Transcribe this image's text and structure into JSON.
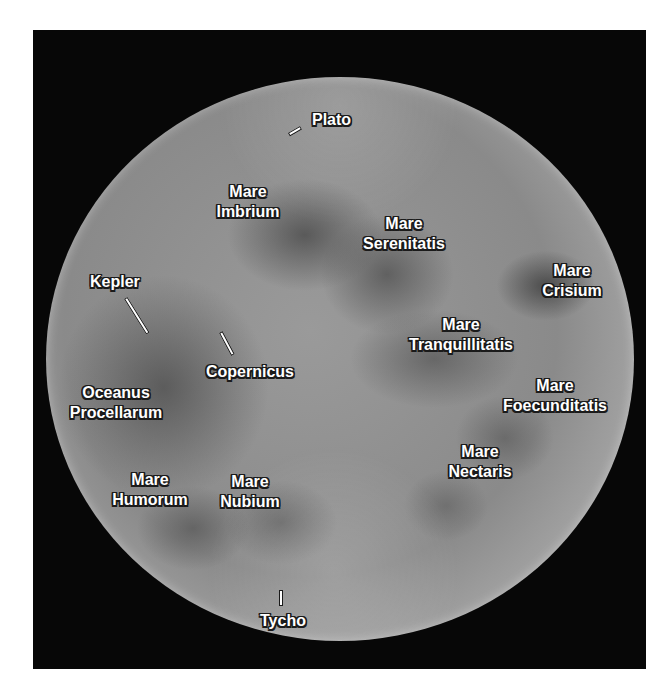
{
  "image": {
    "subject": "full-moon-map",
    "background_color": "#ffffff",
    "frame_color": "#070707",
    "label_color": "#ffffff",
    "label_outline_color": "#1a1a1a"
  },
  "labels": {
    "plato": {
      "line1": "Plato"
    },
    "mare_imbrium": {
      "line1": "Mare",
      "line2": "Imbrium"
    },
    "mare_serenitatis": {
      "line1": "Mare",
      "line2": "Serenitatis"
    },
    "kepler": {
      "line1": "Kepler"
    },
    "mare_crisium": {
      "line1": "Mare",
      "line2": "Crisium"
    },
    "mare_tranquillitatis": {
      "line1": "Mare",
      "line2": "Tranquillitatis"
    },
    "copernicus": {
      "line1": "Copernicus"
    },
    "oceanus_procellarum": {
      "line1": "Oceanus",
      "line2": "Procellarum"
    },
    "mare_foecunditatis": {
      "line1": "Mare",
      "line2": "Foecunditatis"
    },
    "mare_nectaris": {
      "line1": "Mare",
      "line2": "Nectaris"
    },
    "mare_humorum": {
      "line1": "Mare",
      "line2": "Humorum"
    },
    "mare_nubium": {
      "line1": "Mare",
      "line2": "Nubium"
    },
    "tycho": {
      "line1": "Tycho"
    }
  }
}
